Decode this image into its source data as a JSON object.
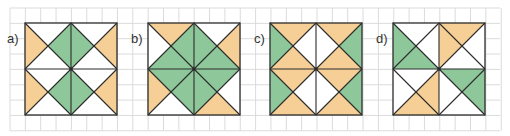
{
  "colors": {
    "background": "#ffffff",
    "grid": "#d9dcd9",
    "line": "#2b2b2b",
    "orange": "#f6cf96",
    "green": "#8ec89a",
    "white": "#ffffff"
  },
  "grid": {
    "x0": 10,
    "y0": 8,
    "cols": 32,
    "rows": 8,
    "cell": 15.35
  },
  "patterns": [
    {
      "label": "a)",
      "x": 25,
      "y": 23,
      "size": 92,
      "style": "quadrant-x",
      "quadrants": {
        "tl": {
          "top": "white",
          "right": "green",
          "bottom": "white",
          "left": "orange"
        },
        "tr": {
          "top": "white",
          "right": "orange",
          "bottom": "white",
          "left": "green"
        },
        "bl": {
          "top": "white",
          "right": "green",
          "bottom": "white",
          "left": "orange"
        },
        "br": {
          "top": "white",
          "right": "orange",
          "bottom": "white",
          "left": "green"
        }
      }
    },
    {
      "label": "b)",
      "x": 148,
      "y": 23,
      "size": 92,
      "style": "diamond-diagonals",
      "diamond": "green",
      "corners": {
        "tl": {
          "edge_top": "orange",
          "edge_side": "white"
        },
        "tr": {
          "edge_top": "white",
          "edge_side": "orange"
        },
        "bl": {
          "edge_bottom": "white",
          "edge_side": "orange"
        },
        "br": {
          "edge_bottom": "orange",
          "edge_side": "white"
        }
      }
    },
    {
      "label": "c)",
      "x": 270,
      "y": 23,
      "size": 92,
      "style": "quadrant-x",
      "quadrants": {
        "tl": {
          "top": "orange",
          "right": "white",
          "bottom": "orange",
          "left": "green"
        },
        "tr": {
          "top": "orange",
          "right": "green",
          "bottom": "orange",
          "left": "white"
        },
        "bl": {
          "top": "orange",
          "right": "white",
          "bottom": "orange",
          "left": "green"
        },
        "br": {
          "top": "orange",
          "right": "green",
          "bottom": "orange",
          "left": "white"
        }
      }
    },
    {
      "label": "d)",
      "x": 393,
      "y": 23,
      "size": 92,
      "style": "quadrant-x",
      "quadrants": {
        "tl": {
          "top": "white",
          "right": "white",
          "bottom": "green",
          "left": "green"
        },
        "tr": {
          "top": "orange",
          "right": "white",
          "bottom": "white",
          "left": "orange"
        },
        "bl": {
          "top": "white",
          "right": "orange",
          "bottom": "orange",
          "left": "white"
        },
        "br": {
          "top": "green",
          "right": "green",
          "bottom": "white",
          "left": "white"
        }
      }
    }
  ]
}
